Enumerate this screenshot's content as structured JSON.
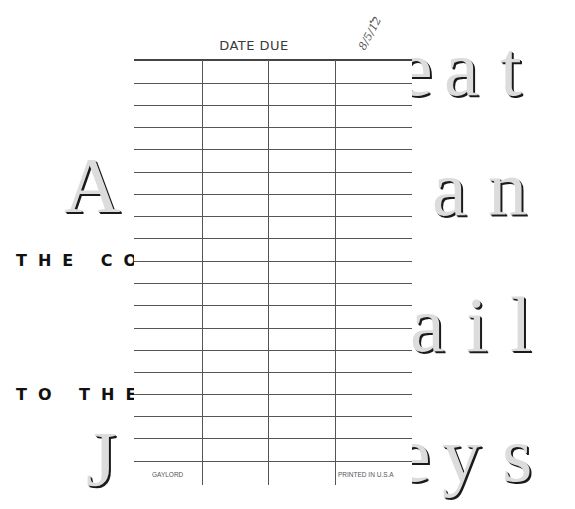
{
  "book_cover": {
    "title_fragments": {
      "line1_right": [
        "e",
        "a",
        "t"
      ],
      "line2_left": "A",
      "line2_right": [
        "a",
        "n"
      ],
      "line3_right": [
        "a",
        "i",
        "l"
      ],
      "line4_left": "J",
      "line4_right": [
        "e",
        "y",
        "s"
      ]
    },
    "subtitle_line1": "THE CON",
    "subtitle_line2": "TO THE"
  },
  "date_due_card": {
    "title": "DATE DUE",
    "handwritten_note": "8/5/12",
    "check_mark": "✓",
    "columns": 4,
    "rows": 19,
    "footer_left": "GAYLORD",
    "footer_right": "PRINTED IN U.S.A"
  },
  "colors": {
    "letter_fill": "#dcdcdc",
    "letter_shadow": "#1a1a1a",
    "grid_line": "#555555",
    "subtitle_text": "#111111"
  }
}
